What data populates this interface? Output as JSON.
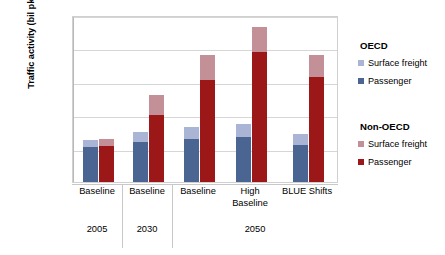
{
  "chart_data": {
    "type": "bar",
    "title": "",
    "xlabel": "",
    "ylabel": "Traffic activity (bil pkm and bil tkm)",
    "ylim": [
      0,
      100000
    ],
    "yticks": [
      "100,000",
      "80,000",
      "60,000",
      "40,000",
      "20,000",
      ",0"
    ],
    "ytick_values": [
      100000,
      80000,
      60000,
      40000,
      20000,
      0
    ],
    "grid": true,
    "stacked": true,
    "legend_position": "right",
    "categories": [
      "Baseline",
      "Baseline",
      "Baseline",
      "High Baseline",
      "BLUE Shifts"
    ],
    "groups": [
      {
        "year": "2005",
        "scenarios": [
          "Baseline"
        ]
      },
      {
        "year": "2030",
        "scenarios": [
          "Baseline"
        ]
      },
      {
        "year": "2050",
        "scenarios": [
          "Baseline",
          "High Baseline",
          "BLUE Shifts"
        ]
      }
    ],
    "series": [
      {
        "name": "OECD Passenger",
        "color": "#4a6591",
        "values": [
          21000,
          24000,
          26000,
          27000,
          22000
        ]
      },
      {
        "name": "OECD Surface freight",
        "color": "#aab4d4",
        "values": [
          4000,
          6000,
          7000,
          8000,
          7000
        ]
      },
      {
        "name": "Non-OECD Passenger",
        "color": "#9c1818",
        "values": [
          21500,
          40000,
          61000,
          78000,
          63000
        ]
      },
      {
        "name": "Non-OECD Surface freight",
        "color": "#c49098",
        "values": [
          4500,
          12000,
          15000,
          15000,
          13000
        ]
      }
    ],
    "bar_totals": {
      "oecd": [
        25000,
        30000,
        33000,
        35000,
        29000
      ],
      "non_oecd": [
        26000,
        52000,
        76000,
        93000,
        76000
      ]
    }
  },
  "legend": {
    "groups": [
      {
        "title": "OECD",
        "items": [
          {
            "label": "Surface freight",
            "swatch": "oecd-freight"
          },
          {
            "label": "Passenger",
            "swatch": "oecd-pass"
          }
        ]
      },
      {
        "title": "Non-OECD",
        "items": [
          {
            "label": "Surface freight",
            "swatch": "nonoecd-freight"
          },
          {
            "label": "Passenger",
            "swatch": "nonoecd-pass"
          }
        ]
      }
    ]
  },
  "axis": {
    "y_title": "Traffic activity (bil pkm and bil tkm)",
    "ticks": [
      {
        "label": "100,000"
      },
      {
        "label": "80,000"
      },
      {
        "label": "60,000"
      },
      {
        "label": "40,000"
      },
      {
        "label": "20,000"
      },
      {
        "label": ",0"
      }
    ],
    "categories": [
      {
        "label": "Baseline"
      },
      {
        "label": "Baseline"
      },
      {
        "label": "Baseline"
      },
      {
        "label": "High Baseline"
      },
      {
        "label": "BLUE Shifts"
      }
    ],
    "years": [
      {
        "label": "2005"
      },
      {
        "label": "2030"
      },
      {
        "label": "2050"
      }
    ]
  },
  "colors": {
    "oecd_freight": "#aab4d4",
    "oecd_passenger": "#4a6591",
    "nonoecd_freight": "#c49098",
    "nonoecd_passenger": "#9c1818",
    "gridline": "#d6d6d6",
    "axis": "#b9b9b9"
  }
}
